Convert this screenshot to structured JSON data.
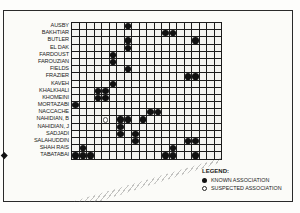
{
  "chart_data": {
    "type": "heatmap",
    "title": "",
    "rows": [
      "AUSBY",
      "BAKHTIAR",
      "BUTLER",
      "EL DAK",
      "FARDOUST",
      "FAROUZIAN",
      "FIELDS",
      "FRAZIER",
      "KAVEH",
      "KHALKHALI",
      "KHOMEINI",
      "MORTAZABI",
      "NACCACHE",
      "NAHIDIAN, B",
      "NAHIDIAN, J",
      "SADJADI",
      "SALAHUDDIN",
      "SHAH RAIS",
      "TABATABAI"
    ],
    "columns_count": 20,
    "column_labels_note": "diagonal column labels illegible in screenshot",
    "highlighted_row": "TABATABAI",
    "known_associations": [
      [
        0,
        7
      ],
      [
        1,
        12
      ],
      [
        1,
        13
      ],
      [
        2,
        7
      ],
      [
        2,
        16
      ],
      [
        3,
        7
      ],
      [
        4,
        5
      ],
      [
        5,
        5
      ],
      [
        6,
        7
      ],
      [
        7,
        15
      ],
      [
        7,
        16
      ],
      [
        8,
        5
      ],
      [
        9,
        3
      ],
      [
        9,
        4
      ],
      [
        10,
        3
      ],
      [
        10,
        4
      ],
      [
        11,
        0
      ],
      [
        12,
        10
      ],
      [
        12,
        11
      ],
      [
        13,
        6
      ],
      [
        13,
        7
      ],
      [
        13,
        9
      ],
      [
        14,
        6
      ],
      [
        15,
        6
      ],
      [
        15,
        8
      ],
      [
        16,
        8
      ],
      [
        16,
        15
      ],
      [
        16,
        16
      ],
      [
        17,
        1
      ],
      [
        17,
        13
      ],
      [
        18,
        0
      ],
      [
        18,
        1
      ],
      [
        18,
        2
      ],
      [
        18,
        12
      ],
      [
        18,
        13
      ],
      [
        18,
        16
      ]
    ],
    "suspected_associations": [
      [
        13,
        4
      ]
    ],
    "legend": {
      "title": "LEGEND:",
      "entries": [
        "KNOWN ASSOCIATION",
        "SUSPECTED ASSOCIATION"
      ]
    }
  },
  "legend": {
    "title": "LEGEND:",
    "known": "KNOWN ASSOCIATION",
    "suspected": "SUSPECTED ASSOCIATION"
  },
  "rows": [
    "AUSBY",
    "BAKHTIAR",
    "BUTLER",
    "EL DAK",
    "FARDOUST",
    "FAROUZIAN",
    "FIELDS",
    "FRAZIER",
    "KAVEH",
    "KHALKHALI",
    "KHOMEINI",
    "MORTAZABI",
    "NACCACHE",
    "NAHIDIAN, B",
    "NAHIDIAN, J",
    "SADJADI",
    "SALAHUDDIN",
    "SHAH RAIS",
    "TABATABAI"
  ]
}
